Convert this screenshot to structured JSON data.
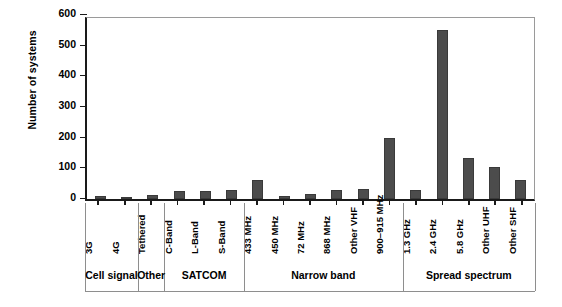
{
  "chart_data": {
    "type": "bar",
    "title": "",
    "subtitle": "",
    "xlabel": "",
    "ylabel": "Number of systems",
    "ylim": [
      0,
      600
    ],
    "yticks": [
      0,
      100,
      200,
      300,
      400,
      500,
      600
    ],
    "grid": false,
    "legend": null,
    "bar_color": "#4c4c4c",
    "axis_color": "#1a1a1a",
    "categories": [
      "3G",
      "4G",
      "Tethered",
      "C-Band",
      "L-Band",
      "S-Band",
      "433 MHz",
      "450 MHz",
      "72 MHz",
      "868 MHz",
      "Other VHF",
      "900–915 MHz",
      "1.3 GHz",
      "2.4 GHz",
      "5.8 GHz",
      "Other UHF",
      "Other SHF"
    ],
    "values": [
      10,
      5,
      12,
      27,
      26,
      28,
      63,
      10,
      15,
      30,
      33,
      198,
      28,
      550,
      135,
      103,
      63
    ],
    "groups": [
      {
        "label": "Cell signal",
        "span": 2
      },
      {
        "label": "Other",
        "span": 1
      },
      {
        "label": "SATCOM",
        "span": 3
      },
      {
        "label": "Narrow band",
        "span": 6
      },
      {
        "label": "Spread spectrum",
        "span": 5
      }
    ]
  }
}
